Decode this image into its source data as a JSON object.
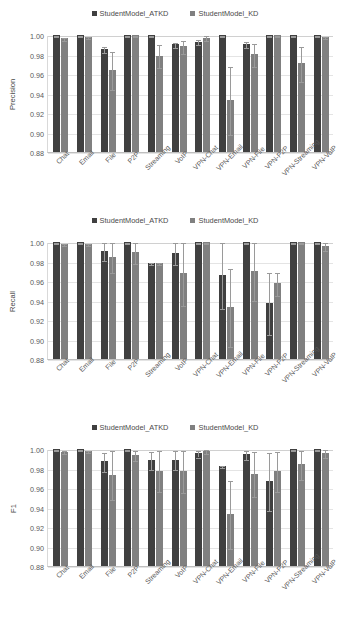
{
  "legend": {
    "entries": [
      {
        "label": "StudentModel_ATKD",
        "color": "#404040"
      },
      {
        "label": "StudentModel_KD",
        "color": "#808080"
      }
    ]
  },
  "axis": {
    "categories": [
      "Chat",
      "Email",
      "File",
      "P2P",
      "Streaming",
      "VoIP",
      "VPN-Chat",
      "VPN-Email",
      "VPN-File",
      "VPN-P2P",
      "VPN-Streaming",
      "VPN-VoIP"
    ],
    "yticks": [
      "1.00",
      "0.98",
      "0.96",
      "0.94",
      "0.92",
      "0.90",
      "0.88"
    ],
    "ymin": 0.88,
    "ymax": 1.0
  },
  "chart_data": [
    {
      "type": "bar",
      "title": "",
      "ylabel": "Precision",
      "xlabel": "",
      "ylim": [
        0.88,
        1.0
      ],
      "ytick_values": [
        1.0,
        0.98,
        0.96,
        0.94,
        0.92,
        0.9,
        0.88
      ],
      "grid": true,
      "legend_position": "top-center",
      "categories": [
        "Chat",
        "Email",
        "File",
        "P2P",
        "Streaming",
        "VoIP",
        "VPN-Chat",
        "VPN-Email",
        "VPN-File",
        "VPN-P2P",
        "VPN-Streaming",
        "VPN-VoIP"
      ],
      "series": [
        {
          "name": "StudentModel_ATKD",
          "color": "#404040",
          "values": [
            1.0,
            1.0,
            0.9853,
            1.0,
            1.0,
            0.9903,
            0.9932,
            1.0,
            0.9908,
            1.0,
            1.0,
            1.0
          ],
          "errors": [
            0.0008,
            0.0008,
            0.0032,
            0.0008,
            0.0008,
            0.0025,
            0.0022,
            0.0008,
            0.0028,
            0.0008,
            0.0008,
            0.0008
          ]
        },
        {
          "name": "StudentModel_KD",
          "color": "#808080",
          "values": [
            0.9966,
            0.998,
            0.9638,
            1.0,
            0.9789,
            0.9883,
            0.9973,
            0.9333,
            0.9803,
            1.0,
            0.971,
            0.998
          ],
          "errors": [
            0.0015,
            0.0012,
            0.0195,
            0.0008,
            0.0118,
            0.0065,
            0.0022,
            0.0345,
            0.0118,
            0.0008,
            0.0178,
            0.0012
          ]
        }
      ]
    },
    {
      "type": "bar",
      "title": "",
      "ylabel": "Recall",
      "xlabel": "",
      "ylim": [
        0.88,
        1.0
      ],
      "ytick_values": [
        1.0,
        0.98,
        0.96,
        0.94,
        0.92,
        0.9,
        0.88
      ],
      "grid": true,
      "legend_position": "top-center",
      "categories": [
        "Chat",
        "Email",
        "File",
        "P2P",
        "Streaming",
        "VoIP",
        "VPN-Chat",
        "VPN-Email",
        "VPN-File",
        "VPN-P2P",
        "VPN-Streaming",
        "VPN-VoIP"
      ],
      "series": [
        {
          "name": "StudentModel_ATKD",
          "color": "#404040",
          "values": [
            1.0,
            1.0,
            0.9912,
            1.0,
            0.9785,
            0.989,
            1.0,
            0.9663,
            1.0,
            0.9378,
            1.0,
            1.0
          ],
          "errors": [
            0.0008,
            0.0008,
            0.0092,
            0.0008,
            0.0008,
            0.0115,
            0.0008,
            0.0345,
            0.0008,
            0.0318,
            0.0008,
            0.0008
          ]
        },
        {
          "name": "StudentModel_KD",
          "color": "#808080",
          "values": [
            0.9978,
            0.998,
            0.9846,
            0.9893,
            0.9785,
            0.9678,
            1.0,
            0.9333,
            0.9703,
            0.9578,
            1.0,
            0.9958
          ],
          "errors": [
            0.0012,
            0.0012,
            0.0158,
            0.0108,
            0.0008,
            0.0325,
            0.0008,
            0.0398,
            0.0298,
            0.0118,
            0.0008,
            0.0042
          ]
        }
      ]
    },
    {
      "type": "bar",
      "title": "",
      "ylabel": "F1",
      "xlabel": "",
      "ylim": [
        0.88,
        1.0
      ],
      "ytick_values": [
        1.0,
        0.98,
        0.96,
        0.94,
        0.92,
        0.9,
        0.88
      ],
      "grid": true,
      "legend_position": "top-center",
      "categories": [
        "Chat",
        "Email",
        "File",
        "P2P",
        "Streaming",
        "VoIP",
        "VPN-Chat",
        "VPN-Email",
        "VPN-File",
        "VPN-P2P",
        "VPN-Streaming",
        "VPN-VoIP"
      ],
      "series": [
        {
          "name": "StudentModel_ATKD",
          "color": "#404040",
          "values": [
            1.0,
            1.0,
            0.9875,
            1.0,
            0.9885,
            0.989,
            0.9958,
            0.9823,
            0.9945,
            0.9673,
            1.0,
            1.0
          ],
          "errors": [
            0.0008,
            0.0008,
            0.0098,
            0.0008,
            0.0092,
            0.0098,
            0.0035,
            0.0008,
            0.0045,
            0.0298,
            0.0008,
            0.0008
          ]
        },
        {
          "name": "StudentModel_KD",
          "color": "#808080",
          "values": [
            0.9973,
            0.998,
            0.9738,
            0.9938,
            0.9778,
            0.9773,
            0.998,
            0.9333,
            0.9748,
            0.9778,
            0.9843,
            0.9958
          ],
          "errors": [
            0.0015,
            0.0012,
            0.0255,
            0.0055,
            0.0208,
            0.0218,
            0.0018,
            0.0345,
            0.0235,
            0.0205,
            0.0148,
            0.0038
          ]
        }
      ]
    }
  ]
}
